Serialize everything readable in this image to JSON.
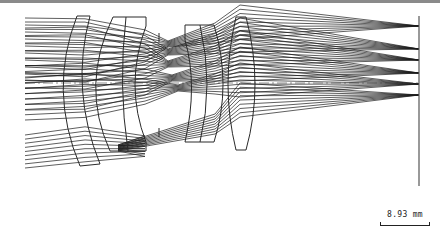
{
  "figure": {
    "type": "optical-lens-layout",
    "scale_bar": {
      "label": "8.93 mm"
    },
    "colors": {
      "rays": "#1a1a1a",
      "lens": "#2a2a2a",
      "image_plane": "#555555",
      "axis": "#444444",
      "frame": "#8a8a8a"
    },
    "elements": [
      {
        "name": "element-1-meniscus"
      },
      {
        "name": "element-2"
      },
      {
        "name": "aperture-stop"
      },
      {
        "name": "element-3"
      },
      {
        "name": "element-4"
      },
      {
        "name": "image-plane"
      }
    ],
    "field_count": 6
  }
}
